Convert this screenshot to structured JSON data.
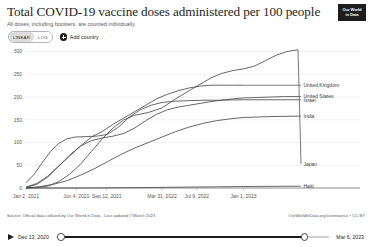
{
  "header": {
    "title": "Total COVID-19 vaccine doses administered per 100 people",
    "subtitle": "All doses, including boosters, are counted individually.",
    "logo_line1": "Our World",
    "logo_line2": "in Data"
  },
  "toolbar": {
    "scale_linear": "LINEAR",
    "scale_log": "LOG",
    "add_country": "Add country"
  },
  "footer": {
    "source": "Source: Official data collated by Our World in Data - Last updated 7 March 2023",
    "link": "OurWorldInData.org/coronavirus • CC BY"
  },
  "timeline": {
    "start_date": "Dec 13, 2020",
    "end_date": "Mar 6, 2023",
    "play_label": "play-button"
  },
  "chart_data": {
    "type": "line",
    "title": "Total COVID-19 vaccine doses administered per 100 people",
    "subtitle": "All doses, including boosters, are counted individually.",
    "xlabel": "",
    "ylabel": "",
    "ylim": [
      0,
      310
    ],
    "yticks": [
      0,
      50,
      100,
      150,
      200,
      250,
      300
    ],
    "ytick_labels": [
      "0",
      "50",
      "100",
      "150",
      "200",
      "250",
      "300"
    ],
    "xticks": [
      "Jan 2, 2021",
      "Jun 4, 2021",
      "Sep 12, 2021",
      "Mar 31, 2022",
      "Jul 9, 2022",
      "Jan 1, 2023"
    ],
    "xtick_positions": [
      0.0,
      0.185,
      0.297,
      0.5,
      0.628,
      0.8
    ],
    "grid": true,
    "legend_position": "right-inline",
    "x_range": [
      "Dec 13, 2020",
      "Mar 6, 2023"
    ],
    "series": [
      {
        "name": "Japan",
        "label_y": 53,
        "color": "#4d4d4d",
        "points": [
          [
            0.0,
            0
          ],
          [
            0.04,
            1
          ],
          [
            0.08,
            4
          ],
          [
            0.12,
            14
          ],
          [
            0.16,
            30
          ],
          [
            0.2,
            52
          ],
          [
            0.24,
            80
          ],
          [
            0.28,
            108
          ],
          [
            0.32,
            132
          ],
          [
            0.36,
            150
          ],
          [
            0.4,
            160
          ],
          [
            0.45,
            166
          ],
          [
            0.5,
            176
          ],
          [
            0.55,
            196
          ],
          [
            0.6,
            214
          ],
          [
            0.64,
            228
          ],
          [
            0.68,
            242
          ],
          [
            0.72,
            252
          ],
          [
            0.76,
            258
          ],
          [
            0.8,
            262
          ],
          [
            0.84,
            268
          ],
          [
            0.88,
            280
          ],
          [
            0.92,
            292
          ],
          [
            0.96,
            300
          ],
          [
            1.0,
            304
          ]
        ]
      },
      {
        "name": "United Kingdom",
        "label_y": 226,
        "color": "#4d4d4d",
        "points": [
          [
            0.0,
            2
          ],
          [
            0.04,
            10
          ],
          [
            0.08,
            26
          ],
          [
            0.12,
            48
          ],
          [
            0.16,
            70
          ],
          [
            0.2,
            92
          ],
          [
            0.24,
            112
          ],
          [
            0.28,
            124
          ],
          [
            0.32,
            140
          ],
          [
            0.36,
            154
          ],
          [
            0.4,
            168
          ],
          [
            0.44,
            182
          ],
          [
            0.48,
            196
          ],
          [
            0.52,
            206
          ],
          [
            0.56,
            214
          ],
          [
            0.6,
            220
          ],
          [
            0.64,
            224
          ],
          [
            0.68,
            226
          ],
          [
            0.72,
            226
          ],
          [
            0.76,
            226
          ],
          [
            0.8,
            226
          ]
        ]
      },
      {
        "name": "United States",
        "label_y": 201,
        "color": "#4d4d4d",
        "points": [
          [
            0.0,
            1
          ],
          [
            0.04,
            8
          ],
          [
            0.08,
            24
          ],
          [
            0.12,
            48
          ],
          [
            0.16,
            72
          ],
          [
            0.2,
            92
          ],
          [
            0.24,
            104
          ],
          [
            0.28,
            110
          ],
          [
            0.32,
            114
          ],
          [
            0.36,
            120
          ],
          [
            0.4,
            132
          ],
          [
            0.44,
            148
          ],
          [
            0.48,
            162
          ],
          [
            0.52,
            172
          ],
          [
            0.56,
            178
          ],
          [
            0.6,
            182
          ],
          [
            0.64,
            186
          ],
          [
            0.68,
            190
          ],
          [
            0.72,
            193
          ],
          [
            0.76,
            196
          ],
          [
            0.8,
            198
          ],
          [
            0.85,
            199
          ],
          [
            0.9,
            200
          ],
          [
            0.95,
            201
          ],
          [
            1.0,
            201
          ]
        ]
      },
      {
        "name": "Israel",
        "label_y": 194,
        "color": "#4d4d4d",
        "points": [
          [
            0.0,
            12
          ],
          [
            0.03,
            30
          ],
          [
            0.06,
            56
          ],
          [
            0.09,
            80
          ],
          [
            0.12,
            98
          ],
          [
            0.15,
            108
          ],
          [
            0.18,
            112
          ],
          [
            0.22,
            113
          ],
          [
            0.26,
            114
          ],
          [
            0.3,
            118
          ],
          [
            0.34,
            134
          ],
          [
            0.38,
            156
          ],
          [
            0.42,
            172
          ],
          [
            0.46,
            182
          ],
          [
            0.5,
            188
          ],
          [
            0.55,
            191
          ],
          [
            0.6,
            192
          ],
          [
            0.65,
            193
          ],
          [
            0.7,
            193
          ],
          [
            0.8,
            194
          ],
          [
            0.9,
            194
          ],
          [
            1.0,
            194
          ]
        ]
      },
      {
        "name": "India",
        "label_y": 158,
        "color": "#4d4d4d",
        "points": [
          [
            0.0,
            0
          ],
          [
            0.05,
            3
          ],
          [
            0.1,
            8
          ],
          [
            0.15,
            16
          ],
          [
            0.2,
            28
          ],
          [
            0.25,
            42
          ],
          [
            0.3,
            58
          ],
          [
            0.35,
            74
          ],
          [
            0.4,
            88
          ],
          [
            0.45,
            100
          ],
          [
            0.5,
            112
          ],
          [
            0.55,
            124
          ],
          [
            0.6,
            134
          ],
          [
            0.65,
            142
          ],
          [
            0.7,
            148
          ],
          [
            0.75,
            152
          ],
          [
            0.8,
            155
          ],
          [
            0.85,
            156
          ],
          [
            0.9,
            157
          ],
          [
            1.0,
            158
          ]
        ]
      },
      {
        "name": "Haiti",
        "label_y": 4,
        "color": "#4d4d4d",
        "points": [
          [
            0.0,
            0
          ],
          [
            0.2,
            0
          ],
          [
            0.3,
            0.3
          ],
          [
            0.4,
            0.8
          ],
          [
            0.5,
            1.4
          ],
          [
            0.6,
            2.0
          ],
          [
            0.7,
            2.6
          ],
          [
            0.8,
            3.2
          ],
          [
            0.9,
            3.7
          ],
          [
            1.0,
            4.0
          ]
        ]
      }
    ]
  }
}
